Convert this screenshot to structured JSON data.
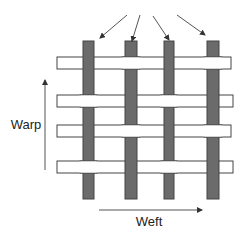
{
  "diagram": {
    "labels": {
      "warp": "Warp",
      "weft": "Weft"
    },
    "colors": {
      "warp_fill": "#6b6b6b",
      "weft_fill": "#ffffff",
      "stroke": "#444444",
      "arrow": "#444444"
    },
    "warp_yarns": [
      {
        "x": 83,
        "width": 11
      },
      {
        "x": 125,
        "width": 12
      },
      {
        "x": 164,
        "width": 10
      },
      {
        "x": 207,
        "width": 12
      }
    ],
    "warp_top": 41,
    "warp_bottom": 199,
    "weft_yarns": [
      {
        "y": 57,
        "height": 12,
        "x1": 57,
        "x2": 231,
        "pattern": "over-warp-1-3"
      },
      {
        "y": 95,
        "height": 12,
        "x1": 57,
        "x2": 233,
        "pattern": "over-warp-2-4"
      },
      {
        "y": 125,
        "height": 12,
        "x1": 57,
        "x2": 231,
        "pattern": "over-warp-1-3"
      },
      {
        "y": 161,
        "height": 12,
        "x1": 57,
        "x2": 233,
        "pattern": "over-warp-2-4"
      }
    ],
    "pointer_arrows": [
      {
        "x1": 127,
        "y1": 15,
        "x2": 100,
        "y2": 38
      },
      {
        "x1": 140,
        "y1": 15,
        "x2": 132,
        "y2": 41
      },
      {
        "x1": 153,
        "y1": 16,
        "x2": 169,
        "y2": 40
      },
      {
        "x1": 177,
        "y1": 15,
        "x2": 205,
        "y2": 35
      }
    ]
  }
}
